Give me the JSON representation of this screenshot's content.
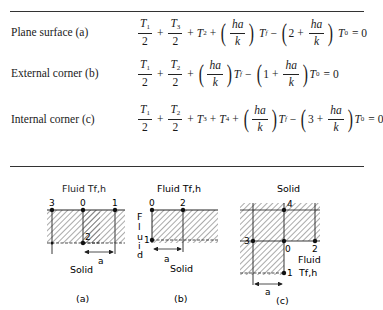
{
  "table": {
    "rows": [
      {
        "label": "Plane surface (a)",
        "equation": "T1/2 + T3/2 + T2 + (ha/k) Tf − (2 + ha/k) T0 = 0",
        "terms": {
          "t1": "T",
          "t1_sub": "1",
          "t3": "T",
          "t3_sub": "3",
          "t2": "T",
          "t2_sub": "2",
          "half": "2",
          "ha": "ha",
          "k": "k",
          "tf": "T",
          "tf_sub": "f",
          "coef": "2",
          "t0": "T",
          "t0_sub": "0",
          "eq": "= 0",
          "plus": "+",
          "minus": "−"
        }
      },
      {
        "label": "External corner (b)",
        "equation": "T1/2 + T2/2 + (ha/k) Tf − (1 + ha/k) T0 = 0",
        "terms": {
          "t1": "T",
          "t1_sub": "1",
          "t2": "T",
          "t2_sub": "2",
          "half": "2",
          "ha": "ha",
          "k": "k",
          "tf": "T",
          "tf_sub": "f",
          "coef": "1",
          "t0": "T",
          "t0_sub": "0",
          "eq": "= 0",
          "plus": "+",
          "minus": "−"
        }
      },
      {
        "label": "Internal corner (c)",
        "equation": "T1/2 + T2/2 + T3 + T4 + (ha/k) Tf − (3 + ha/k) T0 = 0",
        "terms": {
          "t1": "T",
          "t1_sub": "1",
          "t2": "T",
          "t2_sub": "2",
          "t3": "T",
          "t3_sub": "3",
          "t4": "T",
          "t4_sub": "4",
          "half": "2",
          "ha": "ha",
          "k": "k",
          "tf": "T",
          "tf_sub": "f",
          "coef": "3",
          "t0": "T",
          "t0_sub": "0",
          "eq": "= 0",
          "plus": "+",
          "minus": "−"
        }
      }
    ]
  },
  "figures": {
    "a": {
      "caption": "(a)",
      "top_label": "Fluid Tf,h",
      "bottom_label": "Solid",
      "spacing_label": "a",
      "nodes": [
        "3",
        "0",
        "1",
        "2"
      ]
    },
    "b": {
      "caption": "(b)",
      "top_label": "Fluid Tf,h",
      "side_label": "Fluid",
      "bottom_label": "Solid",
      "spacing_label": "a",
      "nodes": [
        "0",
        "2",
        "1"
      ]
    },
    "c": {
      "caption": "(c)",
      "top_label": "Solid",
      "fluid_label": "Fluid",
      "fluid_sub_label": "Tf,h",
      "spacing_label": "a",
      "nodes": [
        "4",
        "3",
        "0",
        "2",
        "1"
      ]
    }
  }
}
